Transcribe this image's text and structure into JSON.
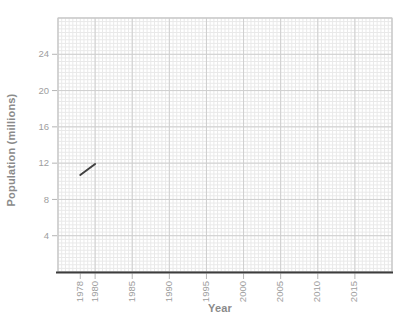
{
  "chart_data": {
    "type": "line",
    "title": "",
    "xlabel": "Year",
    "ylabel": "Population (millions)",
    "xlim": [
      1975,
      2020
    ],
    "ylim": [
      0,
      28
    ],
    "x_ticks": [
      1978,
      1980,
      1985,
      1990,
      1995,
      2000,
      2005,
      2010,
      2015
    ],
    "y_ticks": [
      4,
      8,
      12,
      16,
      20,
      24
    ],
    "x_major_step": 5,
    "y_major_step": 4,
    "x_minor_step": 0.5,
    "y_minor_step": 0.4,
    "grid": "graph-paper",
    "legend": "none",
    "series": [
      {
        "name": "Population",
        "points": [
          [
            1978,
            10.7
          ],
          [
            1980,
            11.9
          ]
        ]
      }
    ],
    "colors": {
      "background": "#ffffff",
      "minor_grid": "#e9e9e9",
      "major_grid": "#cfcfcf",
      "frame": "#c6c6c6",
      "axis_line": "#3d3d3d",
      "tick_mark": "#b5b5b5",
      "tick_label": "#9e9e9e",
      "axis_title": "#8a8a8a",
      "series_line": "#404040"
    }
  }
}
